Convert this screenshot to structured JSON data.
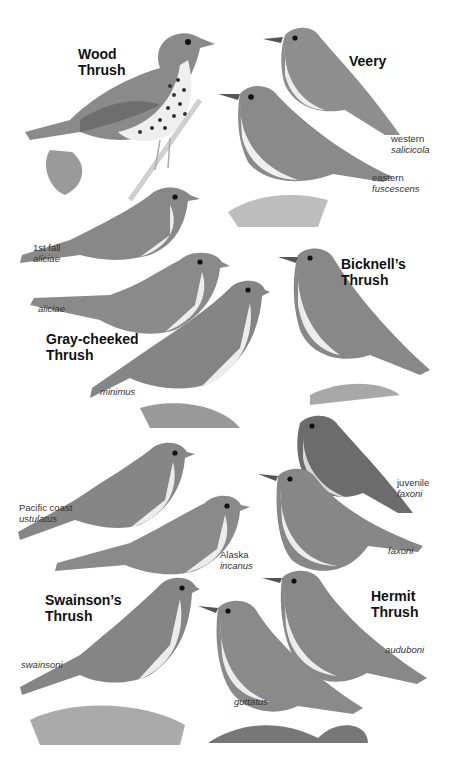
{
  "plate": {
    "background": "#ffffff",
    "species": [
      {
        "name_line1": "Wood",
        "name_line2": "Thrush",
        "forms": []
      },
      {
        "name_line1": "Veery",
        "name_line2": "",
        "forms": [
          {
            "region": "western",
            "subspecies": "salicicola"
          },
          {
            "region": "eastern",
            "subspecies": "fuscescens"
          }
        ]
      },
      {
        "name_line1": "Gray-cheeked",
        "name_line2": "Thrush",
        "forms": [
          {
            "region": "1st fall",
            "subspecies": "aliciae"
          },
          {
            "region": "",
            "subspecies": "aliciae"
          },
          {
            "region": "",
            "subspecies": "minimus"
          }
        ]
      },
      {
        "name_line1": "Bicknell’s",
        "name_line2": "Thrush",
        "forms": []
      },
      {
        "name_line1": "Swainson’s",
        "name_line2": "Thrush",
        "forms": [
          {
            "region": "Pacific coast",
            "subspecies": "ustulatus"
          },
          {
            "region": "Alaska",
            "subspecies": "incanus"
          },
          {
            "region": "",
            "subspecies": "swainsoni"
          }
        ]
      },
      {
        "name_line1": "Hermit",
        "name_line2": "Thrush",
        "forms": [
          {
            "region": "juvenile",
            "subspecies": "faxoni"
          },
          {
            "region": "",
            "subspecies": "faxoni"
          },
          {
            "region": "",
            "subspecies": "auduboni"
          },
          {
            "region": "",
            "subspecies": "guttatus"
          }
        ]
      }
    ]
  }
}
